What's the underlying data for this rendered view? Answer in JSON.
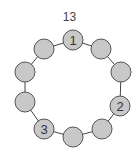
{
  "title": "13",
  "style": {
    "node_fill": "#c8c8c8",
    "node_stroke": "#555555",
    "edge_stroke": "#444444",
    "label_color": "#333333",
    "node_radius": 10
  },
  "nodes": [
    {
      "id": "n1",
      "x": 73,
      "y": 40,
      "label": "1"
    },
    {
      "id": "n2",
      "x": 101,
      "y": 49,
      "label": ""
    },
    {
      "id": "n3",
      "x": 121,
      "y": 72,
      "label": ""
    },
    {
      "id": "n4",
      "x": 120,
      "y": 106,
      "label": "2"
    },
    {
      "id": "n5",
      "x": 102,
      "y": 129,
      "label": ""
    },
    {
      "id": "n6",
      "x": 73,
      "y": 137,
      "label": ""
    },
    {
      "id": "n7",
      "x": 44,
      "y": 129,
      "label": "3"
    },
    {
      "id": "n8",
      "x": 25,
      "y": 102,
      "label": ""
    },
    {
      "id": "n9",
      "x": 25,
      "y": 72,
      "label": ""
    },
    {
      "id": "n10",
      "x": 44,
      "y": 49,
      "label": ""
    }
  ]
}
